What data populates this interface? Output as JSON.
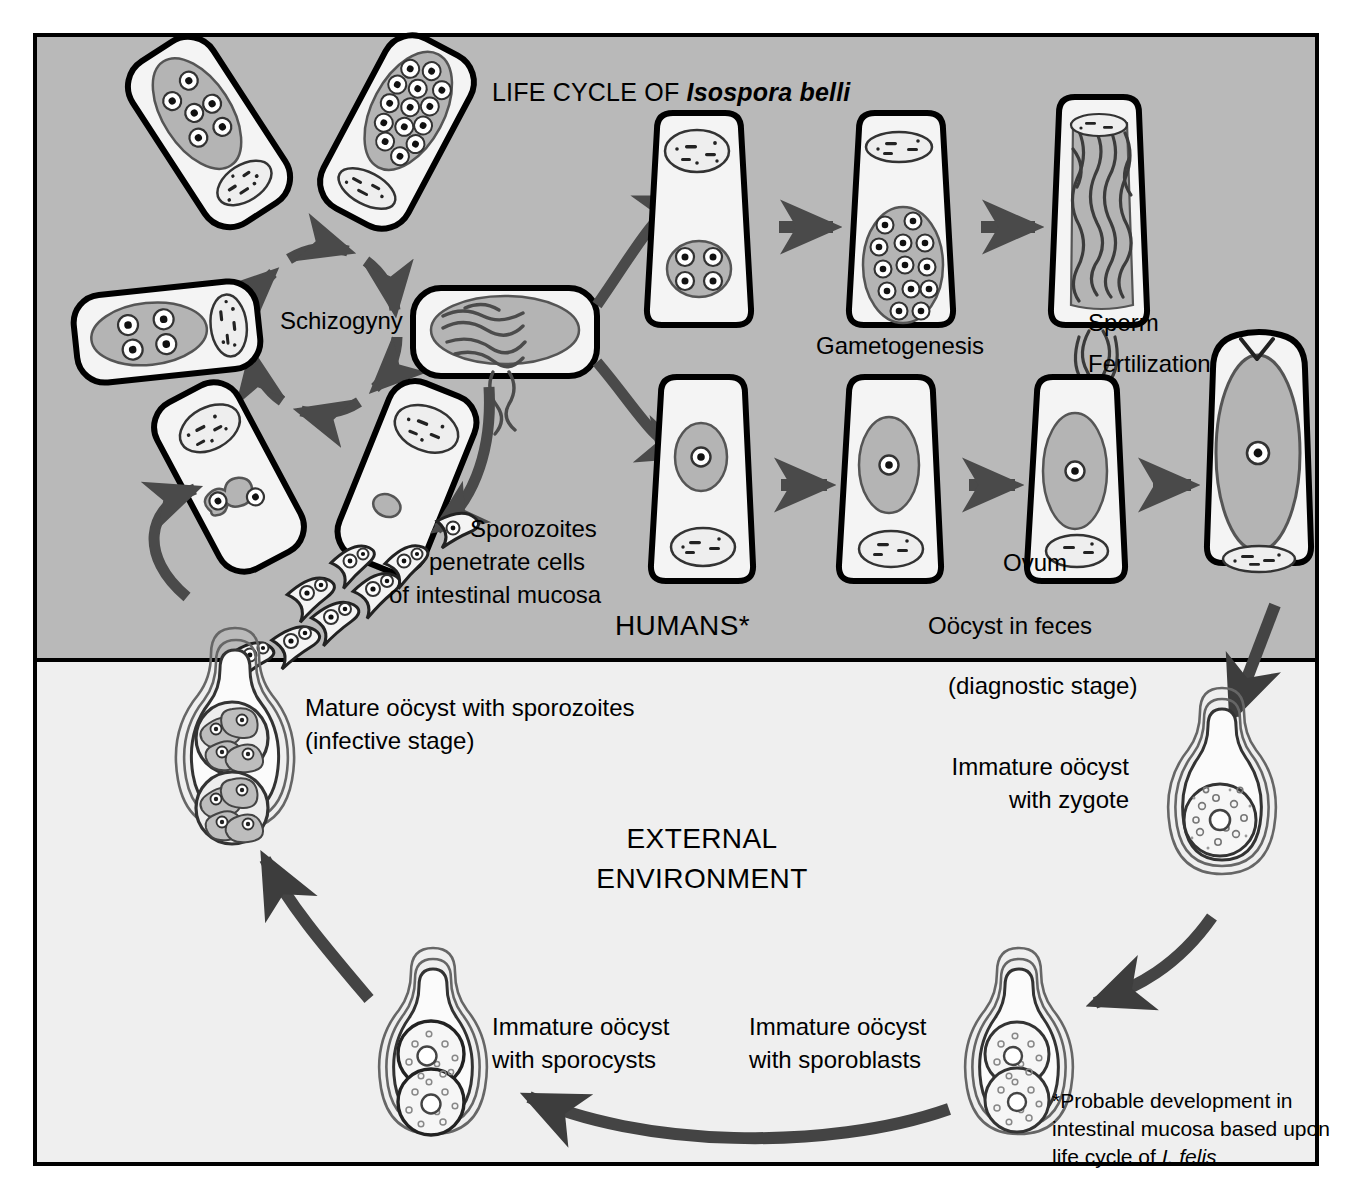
{
  "diagram": {
    "title_prefix": "LIFE CYCLE OF ",
    "title_species": "Isospora belli",
    "zones": {
      "humans": "HUMANS*",
      "external_line1": "EXTERNAL",
      "external_line2": "ENVIRONMENT"
    },
    "labels": {
      "schizogyny": "Schizogyny",
      "gametogenesis": "Gametogenesis",
      "sperm": "Sperm",
      "fertilization": "Fertilization",
      "ovum": "Ovum",
      "sporozoites_l1": "Sporozoites",
      "sporozoites_l2": "penetrate cells",
      "sporozoites_l3": "of intestinal mucosa",
      "oocyst_in_feces": "Oöcyst in feces",
      "diagnostic_stage": "(diagnostic stage)",
      "immature_zygote_l1": "Immature oöcyst",
      "immature_zygote_l2": "with zygote",
      "mature_l1": "Mature oöcyst with sporozoites",
      "mature_l2": "(infective stage)",
      "sporocysts_l1": "Immature oöcyst",
      "sporocysts_l2": "with sporocysts",
      "sporoblasts_l1": "Immature oöcyst",
      "sporoblasts_l2": "with sporoblasts"
    },
    "footnote": {
      "line1": "*Probable development in",
      "line2": "intestinal mucosa based upon",
      "line3_prefix": "life cycle of ",
      "line3_species": "I. felis"
    },
    "colors": {
      "humans_background": "#b9b9b9",
      "external_background": "#efefef",
      "outline": "#000000",
      "arrow": "#4a4a4a",
      "cell_fill": "#f2f2f2",
      "nucleus_fill": "#b0b0b0",
      "oocyst_fill": "#fbfbfb"
    }
  }
}
